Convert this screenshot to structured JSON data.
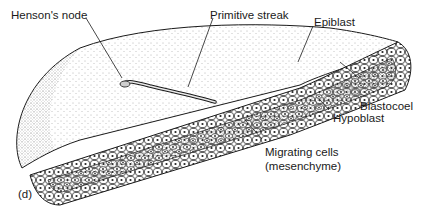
{
  "figure": {
    "panel_label": "(d)",
    "labels": {
      "hensons_node": "Henson's node",
      "primitive_streak": "Primitive streak",
      "epiblast": "Epiblast",
      "blastocoel": "Blastocoel",
      "hypoblast": "Hypoblast",
      "migrating_cells_line1": "Migrating cells",
      "migrating_cells_line2": "(mesenchyme)"
    },
    "colors": {
      "ink": "#1a1a1a",
      "stipple": "#555555",
      "background": "#ffffff"
    }
  }
}
